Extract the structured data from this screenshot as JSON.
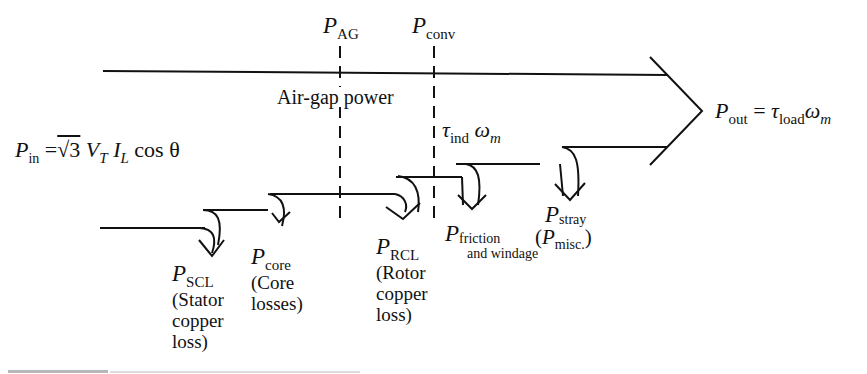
{
  "diagram": {
    "stages": {
      "p_ag": {
        "symbol": "P",
        "subscript": "AG"
      },
      "p_conv": {
        "symbol": "P",
        "subscript": "conv"
      }
    },
    "air_gap_label": "Air-gap power",
    "input": {
      "symbol": "P",
      "subscript": "in",
      "equals": "=",
      "sqrt": "√3",
      "vt": "V",
      "vt_sub": "T",
      "il": "I",
      "il_sub": "L",
      "cos": "cos θ"
    },
    "torque_label": {
      "tau": "τ",
      "tau_sub": "ind",
      "omega": "ω",
      "omega_sub": "m"
    },
    "output": {
      "symbol": "P",
      "subscript": "out",
      "equals": "=",
      "tau": "τ",
      "tau_sub": "load",
      "omega": "ω",
      "omega_sub": "m"
    },
    "losses": [
      {
        "symbol": "P",
        "subscript": "SCL",
        "description": "(Stator\ncopper\nloss)"
      },
      {
        "symbol": "P",
        "subscript": "core",
        "description": "(Core\nlosses)"
      },
      {
        "symbol": "P",
        "subscript": "RCL",
        "description": "(Rotor\ncopper\nloss)"
      },
      {
        "symbol": "P",
        "subscript": "friction",
        "subscript2": "and windage"
      },
      {
        "symbol": "P",
        "subscript": "stray",
        "alt_open": "(",
        "alt_symbol": "P",
        "alt_subscript": "misc.",
        "alt_close": ")"
      }
    ]
  }
}
